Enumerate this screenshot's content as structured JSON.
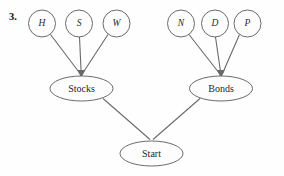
{
  "page": {
    "problem_number": "3.",
    "background_color": "#fefefe",
    "stroke_color": "#5a5a5a",
    "text_color": "#1f1f1f"
  },
  "diagram": {
    "type": "tree",
    "orientation": "bottom-up",
    "root": {
      "id": "start",
      "label": "Start",
      "shape": "ellipse",
      "cx": 151.5,
      "cy": 153.5,
      "rx": 31.5,
      "ry": 12.5
    },
    "branches": [
      {
        "id": "stocks",
        "label": "Stocks",
        "shape": "ellipse",
        "cx": 81.5,
        "cy": 88.5,
        "rx": 31.5,
        "ry": 12.5,
        "leaves": [
          {
            "id": "h",
            "label": "H",
            "shape": "circle",
            "cx": 42,
            "cy": 23.5,
            "r": 13.5
          },
          {
            "id": "s",
            "label": "S",
            "shape": "circle",
            "cx": 79,
            "cy": 23.5,
            "r": 13.5
          },
          {
            "id": "w",
            "label": "W",
            "shape": "circle",
            "cx": 116.5,
            "cy": 23.5,
            "r": 13.5
          }
        ]
      },
      {
        "id": "bonds",
        "label": "Bonds",
        "shape": "ellipse",
        "cx": 221,
        "cy": 88.5,
        "rx": 31.5,
        "ry": 12.5,
        "leaves": [
          {
            "id": "n",
            "label": "N",
            "shape": "circle",
            "cx": 181,
            "cy": 23.5,
            "r": 13.5
          },
          {
            "id": "d",
            "label": "D",
            "shape": "circle",
            "cx": 215,
            "cy": 23.5,
            "r": 13.5
          },
          {
            "id": "p",
            "label": "P",
            "shape": "circle",
            "cx": 247.5,
            "cy": 23.5,
            "r": 13.5
          }
        ]
      }
    ],
    "edges": [
      {
        "from": "h",
        "to": "stocks"
      },
      {
        "from": "s",
        "to": "stocks"
      },
      {
        "from": "w",
        "to": "stocks"
      },
      {
        "from": "n",
        "to": "bonds"
      },
      {
        "from": "d",
        "to": "bonds"
      },
      {
        "from": "p",
        "to": "bonds"
      },
      {
        "from": "stocks",
        "to": "start"
      },
      {
        "from": "bonds",
        "to": "start"
      }
    ]
  }
}
